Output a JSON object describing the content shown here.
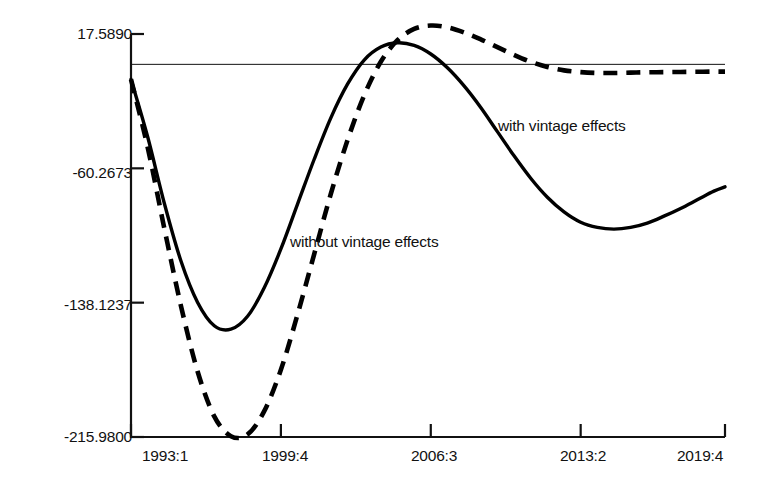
{
  "chart_data": {
    "type": "line",
    "title": "",
    "xlabel": "",
    "ylabel": "",
    "xlim": [
      "1993:1",
      "2019:4"
    ],
    "ylim": [
      -215.98,
      17.589
    ],
    "grid": false,
    "legend_position": "inline-annotations",
    "reference_line": 0,
    "y_ticks": [
      "17.5890",
      "-60.2673",
      "-138.1237",
      "-215.9800"
    ],
    "y_tick_values": [
      17.589,
      -60.2673,
      -138.1237,
      -215.98
    ],
    "x_ticks": [
      "1993:1",
      "1999:4",
      "2006:3",
      "2013:2",
      "2019:4"
    ],
    "annotations": [
      {
        "text": "with vintage effects",
        "x": "2004:2",
        "y": -72
      },
      {
        "text": "without vintage effects",
        "x": "1996:4",
        "y": -130
      }
    ],
    "series": [
      {
        "name": "with vintage effects",
        "style": "solid",
        "color": "#000000",
        "x": [
          "1993:1",
          "1993:4",
          "1994:3",
          "1995:2",
          "1996:1",
          "1996:4",
          "1997:3",
          "1998:2",
          "1999:1",
          "1999:4",
          "2000:3",
          "2001:2",
          "2002:1",
          "2002:4",
          "2003:3",
          "2004:2",
          "2005:1",
          "2005:4",
          "2006:3",
          "2007:2",
          "2008:1",
          "2008:4",
          "2009:3",
          "2010:2",
          "2011:1",
          "2011:4",
          "2012:3",
          "2013:2",
          "2014:1",
          "2014:4",
          "2015:3",
          "2016:2",
          "2017:1",
          "2017:4",
          "2018:3",
          "2019:2",
          "2019:4"
        ],
        "values": [
          -8.7,
          -42.0,
          -80.5,
          -114.0,
          -138.0,
          -151.5,
          -153.5,
          -146.0,
          -129.5,
          -107.0,
          -81.0,
          -55.0,
          -31.0,
          -11.5,
          2.5,
          10.0,
          12.5,
          11.0,
          6.0,
          -2.0,
          -12.5,
          -25.0,
          -39.0,
          -53.0,
          -66.0,
          -77.0,
          -85.5,
          -91.5,
          -94.5,
          -95.5,
          -94.5,
          -92.0,
          -88.0,
          -83.5,
          -78.5,
          -73.5,
          -71.0
        ]
      },
      {
        "name": "without vintage effects",
        "style": "dashed",
        "color": "#000000",
        "x": [
          "1993:1",
          "1993:4",
          "1994:3",
          "1995:2",
          "1996:1",
          "1996:4",
          "1997:3",
          "1998:2",
          "1999:1",
          "1999:4",
          "2000:3",
          "2001:2",
          "2002:1",
          "2002:4",
          "2003:3",
          "2004:2",
          "2005:1",
          "2005:4",
          "2006:3",
          "2007:2",
          "2008:1",
          "2008:4",
          "2009:3",
          "2010:2",
          "2011:1",
          "2011:4",
          "2012:3",
          "2013:2",
          "2014:1",
          "2014:4",
          "2015:3",
          "2016:2",
          "2017:1",
          "2017:4",
          "2018:3",
          "2019:2",
          "2019:4"
        ],
        "values": [
          -8.7,
          -48.0,
          -95.0,
          -140.0,
          -178.0,
          -204.0,
          -215.5,
          -214.5,
          -201.0,
          -177.0,
          -145.0,
          -110.0,
          -75.0,
          -44.0,
          -18.0,
          1.5,
          14.0,
          20.5,
          22.5,
          21.5,
          18.5,
          14.5,
          10.0,
          5.5,
          1.5,
          -1.5,
          -3.5,
          -4.5,
          -5.0,
          -5.0,
          -4.8,
          -4.6,
          -4.5,
          -4.4,
          -4.3,
          -4.2,
          -4.2
        ]
      }
    ]
  },
  "axes": {
    "left_px": 131,
    "right_px": 725,
    "top_px": 34,
    "bottom_px": 437,
    "zero_line_px": 63
  }
}
